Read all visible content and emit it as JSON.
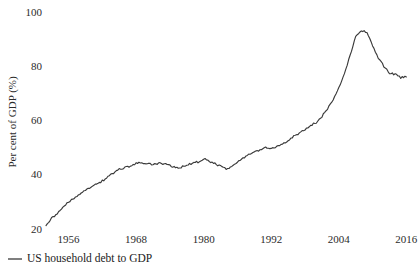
{
  "chart_data": {
    "type": "line",
    "title": "",
    "subtitle": "",
    "xlabel": "",
    "ylabel": "Per cent of GDP (%)",
    "xlim": [
      1952,
      2017
    ],
    "ylim": [
      18,
      102
    ],
    "grid": false,
    "legend_position": "bottom-left",
    "xticks": [
      "1956",
      "1968",
      "1980",
      "1992",
      "2004",
      "2016"
    ],
    "xtick_values": [
      1956,
      1968,
      1980,
      1992,
      2004,
      2016
    ],
    "yticks": [
      "20",
      "40",
      "60",
      "80",
      "100"
    ],
    "ytick_values": [
      20,
      40,
      60,
      80,
      100
    ],
    "series": [
      {
        "name": "US household debt to GDP",
        "color": "#3a3a3a",
        "x": [
          1952,
          1953,
          1954,
          1955,
          1956,
          1957,
          1958,
          1959,
          1960,
          1961,
          1962,
          1963,
          1964,
          1965,
          1966,
          1967,
          1968,
          1969,
          1970,
          1971,
          1972,
          1973,
          1974,
          1975,
          1976,
          1977,
          1978,
          1979,
          1980,
          1981,
          1982,
          1983,
          1984,
          1985,
          1986,
          1987,
          1988,
          1989,
          1990,
          1991,
          1992,
          1993,
          1994,
          1995,
          1996,
          1997,
          1998,
          1999,
          2000,
          2001,
          2002,
          2003,
          2004,
          2005,
          2006,
          2007,
          2008,
          2009,
          2010,
          2011,
          2012,
          2013,
          2014,
          2015,
          2016
        ],
        "values": [
          22.0,
          24.3,
          26.2,
          28.4,
          30.3,
          31.6,
          33.0,
          34.8,
          35.9,
          36.9,
          38.1,
          39.6,
          41.0,
          42.3,
          43.0,
          43.6,
          44.5,
          44.8,
          44.3,
          44.2,
          44.6,
          44.4,
          43.9,
          43.0,
          43.1,
          44.0,
          44.6,
          45.1,
          46.3,
          45.3,
          44.4,
          43.6,
          42.5,
          43.5,
          45.2,
          46.6,
          47.6,
          48.5,
          49.6,
          50.4,
          50.0,
          50.6,
          51.7,
          53.1,
          54.7,
          55.6,
          57.0,
          58.6,
          59.6,
          61.8,
          64.6,
          68.2,
          72.3,
          77.6,
          84.5,
          91.1,
          93.4,
          93.0,
          88.0,
          83.5,
          80.3,
          77.9,
          77.4,
          76.2,
          76.4
        ]
      }
    ]
  },
  "legend": {
    "entries": [
      {
        "label": "US household debt to GDP",
        "marker": "line-dash",
        "color": "#3a3a3a"
      }
    ]
  },
  "axes": {
    "y_title": "Per cent of GDP (%)"
  }
}
